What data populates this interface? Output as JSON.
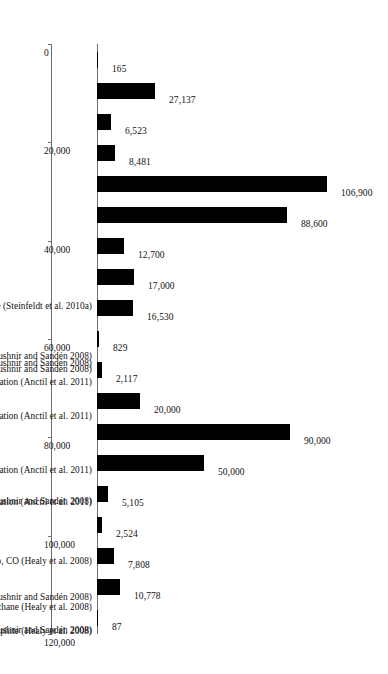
{
  "chart_data": {
    "type": "bar",
    "orientation": "vertical-rotated",
    "title": "",
    "xlabel": "",
    "ylabel": "",
    "ylim": [
      0,
      120000
    ],
    "grid": false,
    "legend": null,
    "tick_labels": [
      "0",
      "20,000",
      "40,000",
      "60,000",
      "80,000",
      "100,000",
      "120,000"
    ],
    "tick_values": [
      0,
      20000,
      40000,
      60000,
      80000,
      100000,
      120000
    ],
    "categories": [
      "MWCNT, fluidbed cat. CVD, ethylene (Steinfeldt et al. 2010a)",
      "MWCNT, SWCNT, Laser abl., graphite (Kushnir and Sandén 2008)",
      "MWCNT, SWCNT, Arc, graphite (Kushnir and Sandén 2008)",
      "C60, C70 pyrolysis, toluene (Kushnir and Sandén 2008)",
      "C60, plasma RF and separation (Anctil et al. 2011)",
      "C60, plasma Arc and separation (Anctil et al. 2011)",
      "C60, Pyrolysis, tetralin and separation (Anctil et al. 2011)",
      "C60, Pyrolysis, toluene and separation (Anctil et al. 2011)",
      "SWCNT, HiPco, CO (Kushnir and Sandén 2008)",
      "MWCNT, floating cat. CVD, benzene (Kushnir and Sandén 2008)",
      "SWCNT, fluidized bed CVD, methane (Kushnir and Sandén 2008)",
      "SWCNT, HiPco, CO (Healy et al. 2008)",
      "SWCNT, CVD, methane (Healy et al. 2008)",
      "SWCNT, Arc, graphite (Healy et al. 2008)",
      "CNF, catalytic pyrolysis, benzene (Steinfeldt et al. 2010b)",
      "CNF, catalytic pyrolysis, benzene (Khanna et al. 2008)",
      "CNF, catalytic pyrolysis, ethylene (Khanna et al. 2008)",
      "CNF, catalytic pyrolysis, methane (Khanna et al. 2008)",
      "Carbon Black (Hischier 2007a)"
    ],
    "category_labels_rich": [
      "MWCNT, fluidbed cat. CVD, ethylene (Steinfeldt et al. 2010a)",
      "MWCNT, SWCNT, Laser abl., graphite (Kushnir and Sandén 2008)",
      "MWCNT, SWCNT, Arc, graphite (Kushnir and Sandén 2008)",
      "C<sub>60</sub>, C<sub>70</sub> pyrolysis, toluene (Kushnir and Sandén 2008)",
      "C<sub>60</sub>, plasma RF and separation (Anctil et al. 2011)",
      "C<sub>60</sub>, plasma Arc and separation (Anctil et al. 2011)",
      "C<sub>60</sub>, Pyrolysis, tetralin and separation (Anctil et al. 2011)",
      "C<sub>60</sub>, Pyrolysis, toluene and separation (Anctil et al. 2011)",
      "SWCNT, HiPco, CO (Kushnir and Sandén 2008)",
      "MWCNT, floating cat. CVD, benzene (Kushnir and Sandén 2008)",
      "SWCNT, fluidized bed CVD, methane (Kushnir and Sandén 2008)",
      "SWCNT, HiPco, CO (Healy et al. 2008)",
      "SWCNT, CVD, methane (Healy et al. 2008)",
      "SWCNT, Arc, graphite (Healy et al. 2008)",
      "CNF, catalytic pyrolysis, benzene (Steinfeldt et al. 2010b)",
      "CNF, catalytic pyrolysis, benzene (Khanna et al. 2008)",
      "CNF, catalytic pyrolysis, ethylene (Khanna et al. 2008)",
      "CNF, catalytic pyrolysis, methane (Khanna et al. 2008)",
      "Carbon Black (Hischier 2007a)"
    ],
    "values": [
      165,
      27137,
      6523,
      8481,
      106900,
      88600,
      12700,
      17000,
      16530,
      829,
      2117,
      20000,
      90000,
      50000,
      5105,
      2524,
      7808,
      10778,
      87
    ],
    "value_labels": [
      "165",
      "27,137",
      "6,523",
      "8,481",
      "106,900",
      "88,600",
      "12,700",
      "17,000",
      "16,530",
      "829",
      "2,117",
      "20,000",
      "90,000",
      "50,000",
      "5,105",
      "2,524",
      "7,808",
      "10,778",
      "87"
    ],
    "bar_color": "#000000",
    "axis_color": "#6d6d6d",
    "background_color": "#ffffff"
  }
}
